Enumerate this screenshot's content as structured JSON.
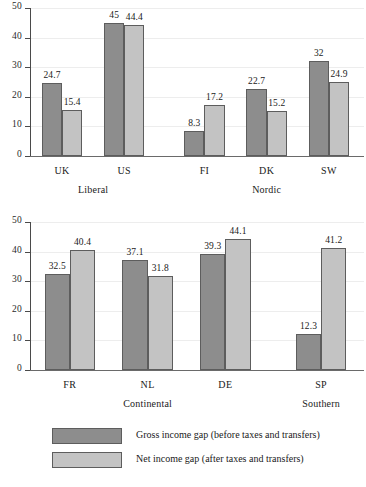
{
  "figure": {
    "clipped_title": "",
    "legend": [
      {
        "series": "gross",
        "label": "Gross income gap (before taxes and transfers)",
        "color": "#8d8d8d"
      },
      {
        "series": "net",
        "label": "Net income gap (after taxes and transfers)",
        "color": "#c3c3c3"
      }
    ]
  },
  "chart_data": [
    {
      "type": "bar",
      "title": "",
      "xlabel": "",
      "ylabel": "",
      "ylim": [
        0,
        50
      ],
      "yticks": [
        "0",
        "10",
        "20",
        "30",
        "40",
        "50"
      ],
      "grid": true,
      "legend_position": "below-figure",
      "categories": [
        "UK",
        "US",
        "FI",
        "DK",
        "SW"
      ],
      "groups": [
        {
          "label": "Liberal",
          "categories": [
            "UK",
            "US"
          ]
        },
        {
          "label": "Nordic",
          "categories": [
            "FI",
            "DK",
            "SW"
          ]
        }
      ],
      "series": [
        {
          "name": "Gross income gap (before taxes and transfers)",
          "color": "#8d8d8d",
          "values": [
            24.7,
            45,
            8.3,
            22.7,
            32
          ],
          "labels": [
            "24.7",
            "45",
            "8.3",
            "22.7",
            "32"
          ]
        },
        {
          "name": "Net income gap (after taxes and transfers)",
          "color": "#c3c3c3",
          "values": [
            15.4,
            44.4,
            17.2,
            15.2,
            24.9
          ],
          "labels": [
            "15.4",
            "44.4",
            "17.2",
            "15.2",
            "24.9"
          ]
        }
      ]
    },
    {
      "type": "bar",
      "title": "",
      "xlabel": "",
      "ylabel": "",
      "ylim": [
        0,
        50
      ],
      "yticks": [
        "0",
        "10",
        "20",
        "30",
        "40",
        "50"
      ],
      "grid": true,
      "legend_position": "below-figure",
      "categories": [
        "FR",
        "NL",
        "DE",
        "SP"
      ],
      "groups": [
        {
          "label": "Continental",
          "categories": [
            "FR",
            "NL",
            "DE"
          ]
        },
        {
          "label": "Southern",
          "categories": [
            "SP"
          ]
        }
      ],
      "series": [
        {
          "name": "Gross income gap (before taxes and transfers)",
          "color": "#8d8d8d",
          "values": [
            32.5,
            37.1,
            39.3,
            12.3
          ],
          "labels": [
            "32.5",
            "37.1",
            "39.3",
            "12.3"
          ]
        },
        {
          "name": "Net income gap (after taxes and transfers)",
          "color": "#c3c3c3",
          "values": [
            40.4,
            31.8,
            44.1,
            41.2
          ],
          "labels": [
            "40.4",
            "31.8",
            "44.1",
            "41.2"
          ]
        }
      ]
    }
  ]
}
